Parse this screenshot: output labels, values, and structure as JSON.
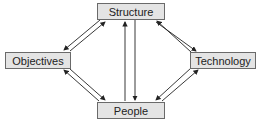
{
  "diagram": {
    "nodes": [
      {
        "id": "structure",
        "label": "Structure"
      },
      {
        "id": "objectives",
        "label": "Objectives"
      },
      {
        "id": "technology",
        "label": "Technology"
      },
      {
        "id": "people",
        "label": "People"
      }
    ],
    "edges": [
      {
        "from": "structure",
        "to": "objectives"
      },
      {
        "from": "objectives",
        "to": "structure"
      },
      {
        "from": "structure",
        "to": "technology"
      },
      {
        "from": "technology",
        "to": "structure"
      },
      {
        "from": "objectives",
        "to": "people"
      },
      {
        "from": "people",
        "to": "objectives"
      },
      {
        "from": "technology",
        "to": "people"
      },
      {
        "from": "people",
        "to": "technology"
      },
      {
        "from": "structure",
        "to": "people"
      },
      {
        "from": "people",
        "to": "structure"
      }
    ],
    "colors": {
      "box_fill": "#e4e4e4",
      "box_border": "#6a6a6a",
      "arrow": "#222222"
    }
  }
}
